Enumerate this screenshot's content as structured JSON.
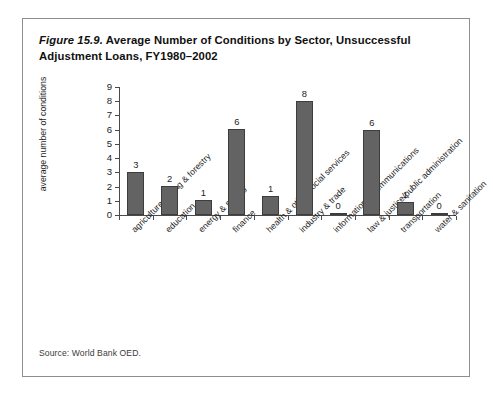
{
  "figure": {
    "number": "Figure 15.9.",
    "title_rest": " Average Number of Conditions by Sector, Unsuccessful Adjustment Loans, FY1980–2002",
    "source": "Source: World Bank OED."
  },
  "chart_data": {
    "type": "bar",
    "title": "Figure 15.9. Average Number of Conditions by Sector, Unsuccessful Adjustment Loans, FY1980–2002",
    "xlabel": "",
    "ylabel": "average number of conditions",
    "ylim": [
      0,
      9
    ],
    "ytick_labels": [
      "0",
      "1",
      "2",
      "3",
      "4",
      "5",
      "6",
      "7",
      "8",
      "9"
    ],
    "yticks": [
      0,
      1,
      2,
      3,
      4,
      5,
      6,
      7,
      8,
      9
    ],
    "grid": false,
    "legend": null,
    "bar_color": "#636363",
    "bar_edge_color": "#3d3d3d",
    "categories": [
      "agriculture fishing & forestry",
      "education",
      "energy & mining",
      "finance",
      "health & other social services",
      "industry & trade",
      "information & communications",
      "law & justice/public administration",
      "transportation",
      "water & sanitation"
    ],
    "values": [
      3.05,
      2.05,
      1.08,
      6.05,
      1.35,
      8.05,
      0.05,
      6.0,
      0.9,
      0.05
    ],
    "data_labels": [
      "3",
      "2",
      "1",
      "6",
      "1",
      "8",
      "0",
      "6",
      "1",
      "0"
    ]
  }
}
